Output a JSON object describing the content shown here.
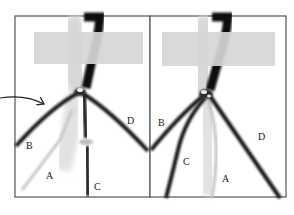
{
  "diagram": {
    "type": "knot-illustration",
    "panels": [
      {
        "id": "left",
        "strand_labels": [
          {
            "text": "B",
            "x": 26,
            "y": 149
          },
          {
            "text": "A",
            "x": 46,
            "y": 179
          },
          {
            "text": "C",
            "x": 94,
            "y": 190
          },
          {
            "text": "D",
            "x": 127,
            "y": 124
          }
        ],
        "has_arrow": true
      },
      {
        "id": "right",
        "strand_labels": [
          {
            "text": "B",
            "x": 158,
            "y": 126
          },
          {
            "text": "C",
            "x": 183,
            "y": 165
          },
          {
            "text": "A",
            "x": 222,
            "y": 182
          },
          {
            "text": "D",
            "x": 258,
            "y": 140
          }
        ],
        "has_arrow": false
      }
    ],
    "colors": {
      "frame": "#555555",
      "cord": "#151515",
      "light_cord": "#c8c8c8",
      "tape": "#d6d6d6",
      "background": "#ffffff"
    }
  }
}
